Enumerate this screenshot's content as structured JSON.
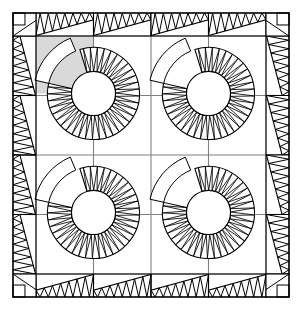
{
  "document": {
    "title": "Quilt Block Layout Diagram",
    "kind": "quilt-pattern-diagram",
    "canvas": {
      "width": 302,
      "height": 310,
      "background": "#ffffff"
    }
  },
  "colors": {
    "outline": "#000000",
    "grid_line": "#808080",
    "shaded_patch": "#d9d9d9",
    "background": "#ffffff",
    "fill_white": "#ffffff"
  },
  "frame": {
    "label": "outer-quilt-frame",
    "x": 13,
    "y": 13,
    "width": 276,
    "height": 284,
    "stroke_width": 1.2
  },
  "border": {
    "label": "sawtooth-pieced-border",
    "band_thickness": 23,
    "corner_square_size": 23,
    "segments_per_side": 4,
    "teeth_per_segment": 7,
    "taper": "wide-to-narrow",
    "direction_note": "each border segment tapers from wide end to narrow end creating rotational symmetry"
  },
  "grid": {
    "label": "block-grid",
    "rows": 4,
    "cols": 4,
    "inner_x": 36,
    "inner_y": 36,
    "inner_width": 230,
    "inner_height": 238,
    "line_color": "#808080",
    "line_width": 1.1
  },
  "motifs": {
    "label": "new-york-beauty-spiral-block",
    "count": 4,
    "layout": "2x2",
    "inner_radius": 22,
    "outer_radius": 46,
    "spike_count": 34,
    "arc_sweep_degrees": 300,
    "centers": [
      {
        "name": "motif-top-left",
        "cx": 93.5,
        "cy": 93.5,
        "shaded": true
      },
      {
        "name": "motif-top-right",
        "cx": 208.5,
        "cy": 93.5,
        "shaded": false
      },
      {
        "name": "motif-bottom-left",
        "cx": 93.5,
        "cy": 212.5,
        "shaded": false
      },
      {
        "name": "motif-bottom-right",
        "cx": 208.5,
        "cy": 212.5,
        "shaded": false
      }
    ]
  },
  "shaded_patch": {
    "label": "highlighted-quarter-block",
    "description": "single gray shaded square in upper-left quadrant of the top-left motif",
    "x": 36,
    "y": 36,
    "width": 57.5,
    "height": 57.5,
    "fill": "#d9d9d9"
  },
  "legend": {
    "shaded_meaning": "shaded area indicates one patch unit of the block"
  }
}
